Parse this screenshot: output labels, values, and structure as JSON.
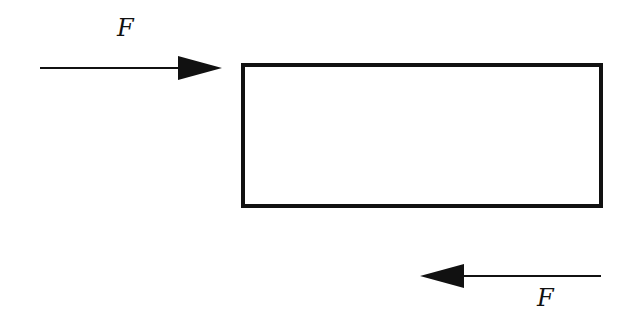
{
  "diagram": {
    "block": {
      "shape": "rectangle"
    },
    "forces": [
      {
        "label": "F",
        "direction": "right",
        "position": "top-left"
      },
      {
        "label": "F",
        "direction": "left",
        "position": "bottom-right"
      }
    ]
  }
}
